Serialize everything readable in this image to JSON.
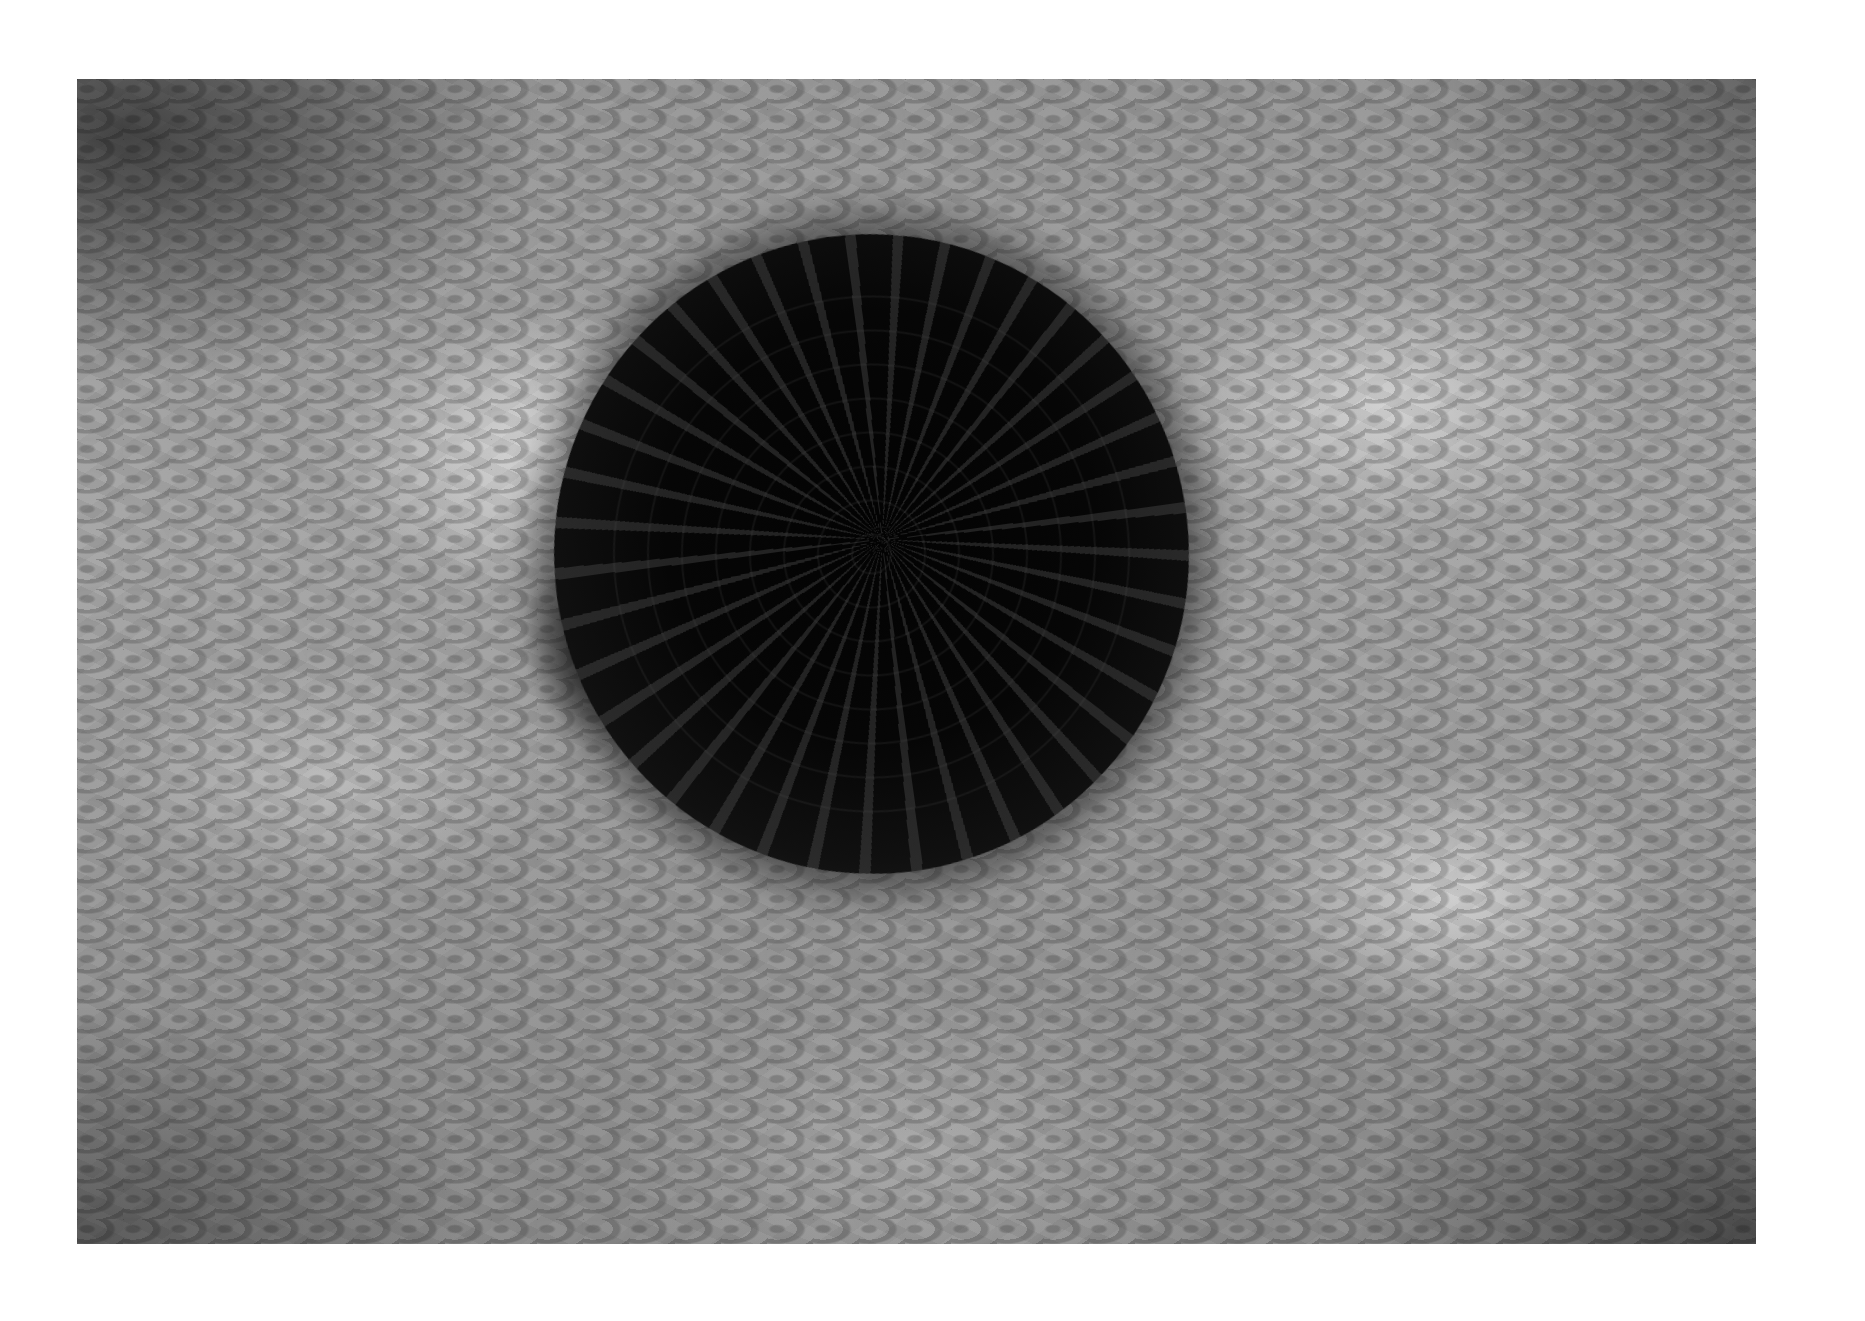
{
  "photo": {
    "subject": "school of fish swirling in a circular vortex over rippled sandy seabed",
    "tone": "black-and-white",
    "colors": {
      "page_background": "#ffffff",
      "school": "#050505",
      "seabed_light": "#d8d8d8",
      "seabed_dark": "#3c3c3c"
    }
  }
}
